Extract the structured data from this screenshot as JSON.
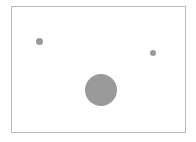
{
  "figure": {
    "width": 196,
    "height": 142,
    "background_color": "#ffffff"
  },
  "plot_frame": {
    "left": 11,
    "top": 6,
    "width": 175,
    "height": 127,
    "border_color": "#b9b9b9",
    "border_width": 1,
    "fill_color": "#ffffff"
  },
  "chart_data": {
    "type": "scatter",
    "title": "",
    "subtitle": "",
    "xlabel": "",
    "ylabel": "",
    "xlim": [
      0,
      175
    ],
    "ylim": [
      0,
      127
    ],
    "grid": false,
    "legend": false,
    "legend_position": "none",
    "axis_ticks": false,
    "axis_tick_labels": [],
    "marker_color": "#9a9a9a",
    "marker_edge_color": "#8d8d8d",
    "series": [
      {
        "name": "bubbles",
        "color": "#9a9a9a",
        "points": [
          {
            "label": "point-1",
            "x": 28,
            "y": 35,
            "size": 7,
            "cx_px": 39,
            "cy_px": 41,
            "diameter_px": 7
          },
          {
            "label": "point-2",
            "x": 142,
            "y": 47,
            "size": 6,
            "cx_px": 153,
            "cy_px": 53,
            "diameter_px": 6
          },
          {
            "label": "point-3",
            "x": 90,
            "y": 84,
            "size": 32,
            "cx_px": 101,
            "cy_px": 90,
            "diameter_px": 32
          }
        ]
      }
    ]
  }
}
